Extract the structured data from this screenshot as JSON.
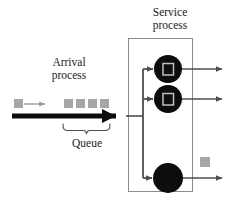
{
  "diagram": {
    "labels": {
      "service_process": "Service\nprocess",
      "service_process_line1": "Service",
      "service_process_line2": "process",
      "arrival_process_line1": "Arrival",
      "arrival_process_line2": "process",
      "queue": "Queue"
    },
    "colors": {
      "ink": "#1a1a1a",
      "line": "#4d4d4d",
      "box_stroke": "#8c8c8c",
      "customer_fill": "#a6a6a6",
      "server_fill": "#0d0d0d",
      "server_glyph": "#bfbfbf",
      "background": "#ffffff"
    },
    "service_box": {
      "x": 128,
      "y": 38,
      "width": 65,
      "height": 154
    },
    "arrival_customer": {
      "x": 14,
      "y": 99,
      "size": 9
    },
    "arrival_thin_arrow": {
      "x1": 24,
      "y1": 104,
      "x2": 46,
      "y2": 104
    },
    "queue_customers": [
      {
        "x": 64,
        "y": 99,
        "size": 9
      },
      {
        "x": 76,
        "y": 99,
        "size": 9
      },
      {
        "x": 88,
        "y": 99,
        "size": 9
      },
      {
        "x": 100,
        "y": 99,
        "size": 9
      }
    ],
    "queue_count": 4,
    "main_arrow": {
      "x1": 12,
      "y1": 116,
      "x2": 130,
      "y2": 116,
      "thickness": 5
    },
    "distributor_x": 143,
    "servers": [
      {
        "id": "server-1",
        "cx": 168,
        "cy": 69,
        "r": 14,
        "occupied": true
      },
      {
        "id": "server-2",
        "cx": 168,
        "cy": 99,
        "r": 14,
        "occupied": true
      },
      {
        "id": "server-3",
        "cx": 168,
        "cy": 178,
        "r": 15,
        "occupied": false
      }
    ],
    "departure_arrows": [
      {
        "y": 69,
        "x1": 168,
        "x2": 228
      },
      {
        "y": 99,
        "x1": 168,
        "x2": 228
      },
      {
        "y": 178,
        "x1": 168,
        "x2": 228
      }
    ],
    "departed_customer": {
      "x": 200,
      "y": 157,
      "size": 10
    },
    "brace": {
      "x1": 63,
      "x2": 110,
      "y": 124,
      "depth": 7
    }
  }
}
